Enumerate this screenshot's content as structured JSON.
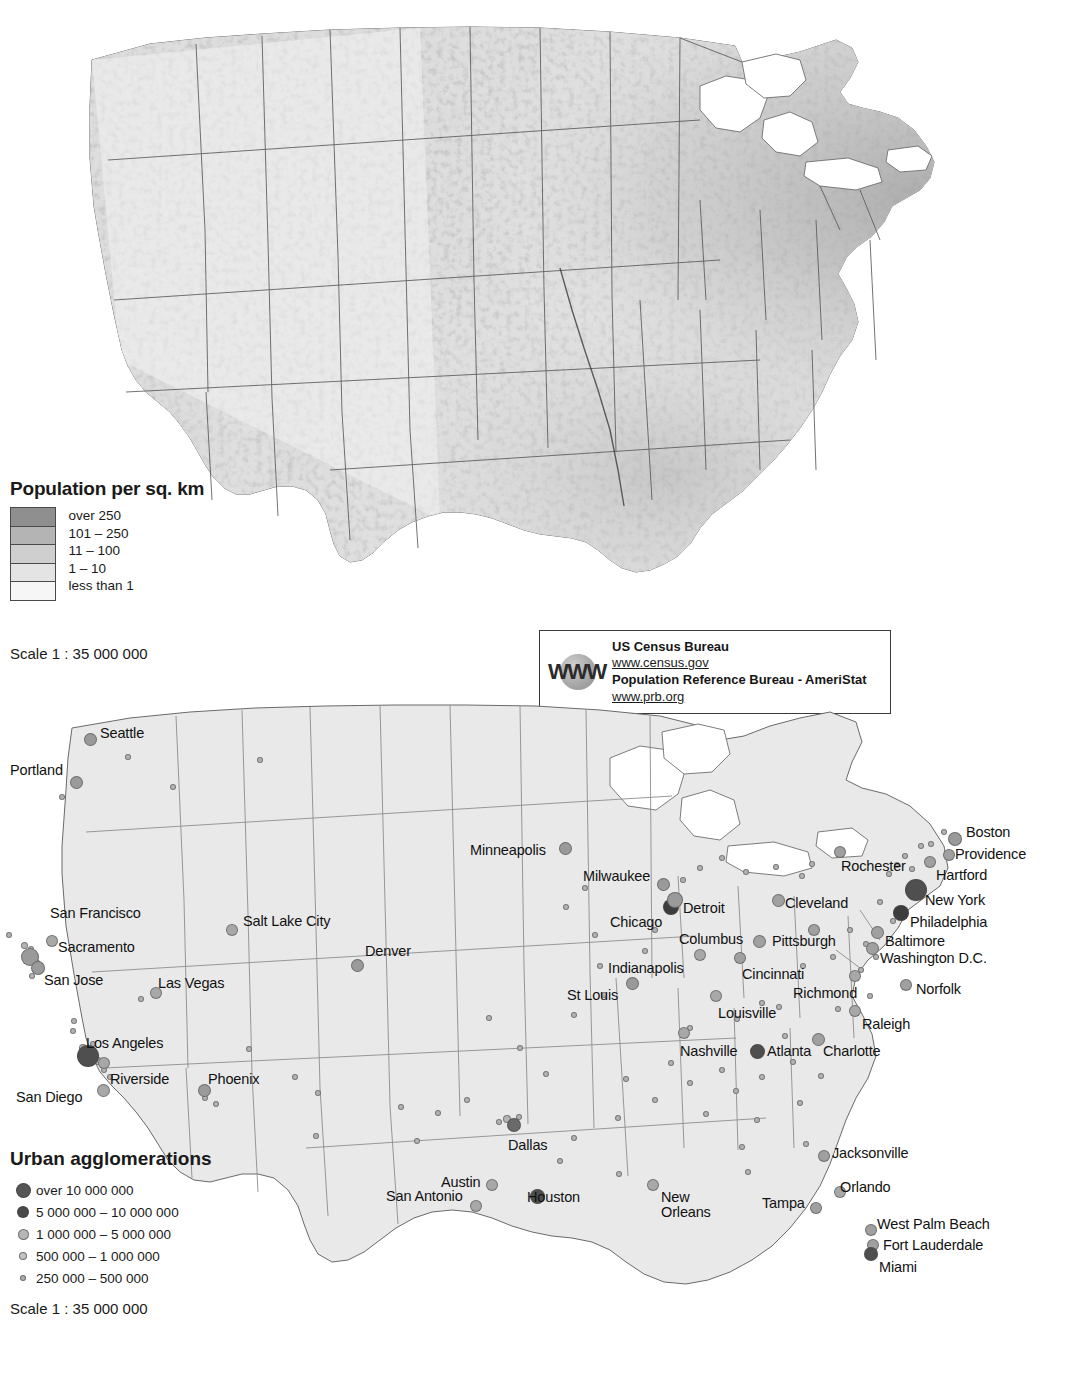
{
  "density_legend": {
    "title": "Population per sq. km",
    "classes": [
      {
        "label": "over 250",
        "color": "#8f8f8f"
      },
      {
        "label": "101 – 250",
        "color": "#b4b4b4"
      },
      {
        "label": "11 – 100",
        "color": "#cfcfcf"
      },
      {
        "label": "1 – 10",
        "color": "#e4e4e4"
      },
      {
        "label": "less than 1",
        "color": "#f6f6f6"
      }
    ],
    "scale": "Scale 1 : 35 000 000"
  },
  "source_box": {
    "icon": "www-globe-icon",
    "icon_text": "WWW",
    "lines": [
      {
        "text": "US Census Bureau",
        "type": "strong"
      },
      {
        "text": "www.census.gov",
        "type": "link"
      },
      {
        "text": "Population Reference Bureau - AmeriStat",
        "type": "strong"
      },
      {
        "text": "www.prb.org",
        "type": "link"
      }
    ]
  },
  "urban_legend": {
    "title": "Urban agglomerations",
    "classes": [
      {
        "label": "over 10 000 000",
        "size": 13,
        "color": "#555555"
      },
      {
        "label": "5 000 000 – 10 000 000",
        "size": 10,
        "color": "#4a4a4a"
      },
      {
        "label": "1 000 000 – 5 000 000",
        "size": 9,
        "color": "#b6b6b6"
      },
      {
        "label": "500 000 – 1 000 000",
        "size": 6,
        "color": "#c2c2c2"
      },
      {
        "label": "250 000 – 500 000",
        "size": 4,
        "color": "#b0b0b0"
      }
    ],
    "scale": "Scale 1 : 35 000 000"
  },
  "map_style": {
    "land_fill": "#e6e6e6",
    "border_color": "#5a5a5a",
    "coast_color": "#6a6a6a",
    "water_fill": "#ffffff"
  },
  "cities": [
    {
      "name": "Seattle",
      "lx": 100,
      "ly": 726,
      "dx": 90,
      "dy": 739,
      "r": 6.5,
      "c": "#9a9a9a"
    },
    {
      "name": "Portland",
      "lx": 10,
      "ly": 763,
      "dx": 76,
      "dy": 782,
      "r": 6.5,
      "c": "#9a9a9a"
    },
    {
      "name": "San Francisco",
      "lx": 50,
      "ly": 906,
      "dx": 30,
      "dy": 957,
      "r": 9,
      "c": "#9a9a9a"
    },
    {
      "name": "Sacramento",
      "lx": 58,
      "ly": 940,
      "dx": 52,
      "dy": 941,
      "r": 6,
      "c": "#a8a8a8"
    },
    {
      "name": "San Jose",
      "lx": 44,
      "ly": 973,
      "dx": 38,
      "dy": 968,
      "r": 7,
      "c": "#9a9a9a"
    },
    {
      "name": "Salt Lake City",
      "lx": 243,
      "ly": 914,
      "dx": 232,
      "dy": 930,
      "r": 6,
      "c": "#a8a8a8"
    },
    {
      "name": "Denver",
      "lx": 365,
      "ly": 944,
      "dx": 357,
      "dy": 965,
      "r": 6.5,
      "c": "#9a9a9a"
    },
    {
      "name": "Las Vegas",
      "lx": 158,
      "ly": 976,
      "dx": 156,
      "dy": 993,
      "r": 6,
      "c": "#a8a8a8"
    },
    {
      "name": "Los Angeles",
      "lx": 86,
      "ly": 1036,
      "dx": 88,
      "dy": 1056,
      "r": 11,
      "c": "#4f4f4f"
    },
    {
      "name": "Riverside",
      "lx": 110,
      "ly": 1072,
      "dx": 104,
      "dy": 1063,
      "r": 6,
      "c": "#a8a8a8"
    },
    {
      "name": "San Diego",
      "lx": 16,
      "ly": 1090,
      "dx": 103,
      "dy": 1090,
      "r": 6.5,
      "c": "#a8a8a8"
    },
    {
      "name": "Phoenix",
      "lx": 208,
      "ly": 1072,
      "dx": 204,
      "dy": 1090,
      "r": 6.5,
      "c": "#9a9a9a"
    },
    {
      "name": "Minneapolis",
      "lx": 470,
      "ly": 843,
      "dx": 565,
      "dy": 848,
      "r": 6.5,
      "c": "#9a9a9a"
    },
    {
      "name": "Milwaukee",
      "lx": 583,
      "ly": 869,
      "dx": 663,
      "dy": 884,
      "r": 6.5,
      "c": "#9a9a9a"
    },
    {
      "name": "Chicago",
      "lx": 610,
      "ly": 915,
      "dx": 671,
      "dy": 907,
      "r": 8,
      "c": "#3d3d3d"
    },
    {
      "name": "Detroit",
      "lx": 683,
      "ly": 901,
      "dx": 675,
      "dy": 900,
      "r": 8,
      "c": "#9a9a9a"
    },
    {
      "name": "Cleveland",
      "lx": 785,
      "ly": 896,
      "dx": 778,
      "dy": 900,
      "r": 6.5,
      "c": "#a0a0a0"
    },
    {
      "name": "Columbus",
      "lx": 679,
      "ly": 932,
      "dx": 759,
      "dy": 941,
      "r": 6.5,
      "c": "#a0a0a0"
    },
    {
      "name": "Indianapolis",
      "lx": 608,
      "ly": 961,
      "dx": 700,
      "dy": 955,
      "r": 6,
      "c": "#a8a8a8"
    },
    {
      "name": "St Louis",
      "lx": 567,
      "ly": 988,
      "dx": 632,
      "dy": 983,
      "r": 6.5,
      "c": "#9a9a9a"
    },
    {
      "name": "Pittsburgh",
      "lx": 772,
      "ly": 934,
      "dx": 814,
      "dy": 930,
      "r": 6,
      "c": "#a0a0a0"
    },
    {
      "name": "Cincinnati",
      "lx": 742,
      "ly": 967,
      "dx": 740,
      "dy": 958,
      "r": 6,
      "c": "#a0a0a0"
    },
    {
      "name": "Louisville",
      "lx": 718,
      "ly": 1006,
      "dx": 716,
      "dy": 996,
      "r": 6,
      "c": "#a8a8a8"
    },
    {
      "name": "Nashville",
      "lx": 680,
      "ly": 1044,
      "dx": 684,
      "dy": 1033,
      "r": 6,
      "c": "#a8a8a8"
    },
    {
      "name": "Richmond",
      "lx": 793,
      "ly": 986,
      "dx": 855,
      "dy": 976,
      "r": 6,
      "c": "#a8a8a8"
    },
    {
      "name": "Norfolk",
      "lx": 916,
      "ly": 982,
      "dx": 906,
      "dy": 985,
      "r": 6,
      "c": "#a0a0a0"
    },
    {
      "name": "Raleigh",
      "lx": 862,
      "ly": 1017,
      "dx": 855,
      "dy": 1011,
      "r": 6,
      "c": "#a8a8a8"
    },
    {
      "name": "Charlotte",
      "lx": 823,
      "ly": 1044,
      "dx": 818,
      "dy": 1039,
      "r": 6.5,
      "c": "#a0a0a0"
    },
    {
      "name": "Atlanta",
      "lx": 767,
      "ly": 1044,
      "dx": 757,
      "dy": 1051,
      "r": 7.5,
      "c": "#4f4f4f"
    },
    {
      "name": "Rochester",
      "lx": 841,
      "ly": 859,
      "dx": 840,
      "dy": 852,
      "r": 6,
      "c": "#a0a0a0"
    },
    {
      "name": "Boston",
      "lx": 966,
      "ly": 825,
      "dx": 955,
      "dy": 839,
      "r": 7,
      "c": "#9a9a9a"
    },
    {
      "name": "Providence",
      "lx": 955,
      "ly": 847,
      "dx": 949,
      "dy": 855,
      "r": 6,
      "c": "#a0a0a0"
    },
    {
      "name": "Hartford",
      "lx": 936,
      "ly": 868,
      "dx": 930,
      "dy": 862,
      "r": 6,
      "c": "#a0a0a0"
    },
    {
      "name": "New York",
      "lx": 925,
      "ly": 893,
      "dx": 916,
      "dy": 890,
      "r": 11,
      "c": "#4f4f4f"
    },
    {
      "name": "Philadelphia",
      "lx": 910,
      "ly": 915,
      "dx": 901,
      "dy": 913,
      "r": 8,
      "c": "#3d3d3d"
    },
    {
      "name": "Baltimore",
      "lx": 885,
      "ly": 934,
      "dx": 877,
      "dy": 932,
      "r": 6.5,
      "c": "#a0a0a0"
    },
    {
      "name": "Washington D.C.",
      "lx": 880,
      "ly": 951,
      "dx": 872,
      "dy": 948,
      "r": 6.5,
      "c": "#a0a0a0"
    },
    {
      "name": "Dallas",
      "lx": 508,
      "ly": 1138,
      "dx": 514,
      "dy": 1125,
      "r": 7,
      "c": "#6a6a6a"
    },
    {
      "name": "Austin",
      "lx": 441,
      "ly": 1175,
      "dx": 492,
      "dy": 1185,
      "r": 6,
      "c": "#a8a8a8"
    },
    {
      "name": "San Antonio",
      "lx": 386,
      "ly": 1189,
      "dx": 476,
      "dy": 1206,
      "r": 6,
      "c": "#a8a8a8"
    },
    {
      "name": "Houston",
      "lx": 527,
      "ly": 1190,
      "dx": 537,
      "dy": 1196,
      "r": 7.5,
      "c": "#4f4f4f"
    },
    {
      "name": "New Orleans",
      "lx": 661,
      "ly": 1190,
      "dx": 653,
      "dy": 1185,
      "r": 6,
      "c": "#a8a8a8"
    },
    {
      "name": "Tampa",
      "lx": 762,
      "ly": 1196,
      "dx": 816,
      "dy": 1208,
      "r": 6,
      "c": "#a0a0a0"
    },
    {
      "name": "Orlando",
      "lx": 840,
      "ly": 1180,
      "dx": 840,
      "dy": 1192,
      "r": 6,
      "c": "#a8a8a8"
    },
    {
      "name": "Jacksonville",
      "lx": 832,
      "ly": 1146,
      "dx": 824,
      "dy": 1156,
      "r": 6,
      "c": "#a0a0a0"
    },
    {
      "name": "West Palm Beach",
      "lx": 877,
      "ly": 1217,
      "dx": 871,
      "dy": 1230,
      "r": 6,
      "c": "#a0a0a0"
    },
    {
      "name": "Fort Lauderdale",
      "lx": 883,
      "ly": 1238,
      "dx": 873,
      "dy": 1245,
      "r": 6,
      "c": "#a0a0a0"
    },
    {
      "name": "Miami",
      "lx": 879,
      "ly": 1260,
      "dx": 871,
      "dy": 1254,
      "r": 7,
      "c": "#4f4f4f"
    }
  ],
  "minor_dots_bottom": [
    [
      128,
      757,
      3
    ],
    [
      173,
      787,
      3
    ],
    [
      62,
      797,
      3
    ],
    [
      260,
      760,
      3
    ],
    [
      9,
      935,
      3
    ],
    [
      24,
      945,
      3.5
    ],
    [
      31,
      949,
      3
    ],
    [
      36,
      963,
      4
    ],
    [
      32,
      976,
      3
    ],
    [
      74,
      1021,
      3
    ],
    [
      83,
      1048,
      4
    ],
    [
      93,
      1044,
      3
    ],
    [
      98,
      1061,
      4
    ],
    [
      104,
      1070,
      3
    ],
    [
      110,
      1077,
      3
    ],
    [
      73,
      1031,
      3
    ],
    [
      205,
      1098,
      3
    ],
    [
      216,
      1104,
      3
    ],
    [
      318,
      1093,
      3
    ],
    [
      316,
      1136,
      3
    ],
    [
      401,
      1107,
      3
    ],
    [
      438,
      1113,
      3
    ],
    [
      467,
      1100,
      3
    ],
    [
      489,
      1018,
      3
    ],
    [
      520,
      1048,
      3
    ],
    [
      546,
      1074,
      3
    ],
    [
      574,
      1138,
      3
    ],
    [
      560,
      1161,
      3
    ],
    [
      417,
      1141,
      3
    ],
    [
      499,
      1122,
      3
    ],
    [
      507,
      1119,
      4
    ],
    [
      519,
      1117,
      3
    ],
    [
      566,
      907,
      3
    ],
    [
      585,
      888,
      3
    ],
    [
      595,
      935,
      3
    ],
    [
      600,
      966,
      3
    ],
    [
      574,
      1015,
      3
    ],
    [
      604,
      995,
      3
    ],
    [
      626,
      1079,
      3
    ],
    [
      619,
      1174,
      3
    ],
    [
      655,
      1100,
      3
    ],
    [
      671,
      1063,
      3
    ],
    [
      690,
      1083,
      3
    ],
    [
      706,
      1114,
      3
    ],
    [
      722,
      1070,
      3
    ],
    [
      736,
      1091,
      3
    ],
    [
      742,
      1147,
      3
    ],
    [
      757,
      1120,
      3
    ],
    [
      748,
      1172,
      3
    ],
    [
      762,
      1077,
      3
    ],
    [
      779,
      1007,
      3
    ],
    [
      785,
      1036,
      3
    ],
    [
      793,
      1062,
      3
    ],
    [
      800,
      1103,
      3
    ],
    [
      806,
      1144,
      3
    ],
    [
      821,
      1076,
      3
    ],
    [
      838,
      1009,
      3
    ],
    [
      803,
      966,
      3
    ],
    [
      833,
      957,
      3
    ],
    [
      861,
      970,
      3
    ],
    [
      870,
      996,
      3
    ],
    [
      876,
      957,
      3
    ],
    [
      889,
      874,
      3
    ],
    [
      897,
      865,
      3
    ],
    [
      905,
      856,
      3
    ],
    [
      912,
      869,
      3
    ],
    [
      921,
      846,
      3
    ],
    [
      931,
      844,
      3
    ],
    [
      944,
      832,
      3
    ],
    [
      802,
      876,
      3
    ],
    [
      812,
      864,
      3
    ],
    [
      776,
      867,
      3
    ],
    [
      746,
      872,
      3
    ],
    [
      722,
      858,
      3
    ],
    [
      700,
      868,
      3
    ],
    [
      683,
      880,
      3
    ],
    [
      655,
      930,
      3
    ],
    [
      645,
      951,
      3
    ],
    [
      618,
      1118,
      3
    ],
    [
      690,
      1028,
      3
    ],
    [
      737,
      1019,
      3
    ],
    [
      762,
      1003,
      3
    ],
    [
      880,
      902,
      3
    ],
    [
      893,
      921,
      3
    ],
    [
      866,
      944,
      3
    ],
    [
      850,
      930,
      3
    ],
    [
      249,
      1049,
      3
    ],
    [
      295,
      1077,
      3
    ],
    [
      141,
      999,
      3
    ]
  ]
}
